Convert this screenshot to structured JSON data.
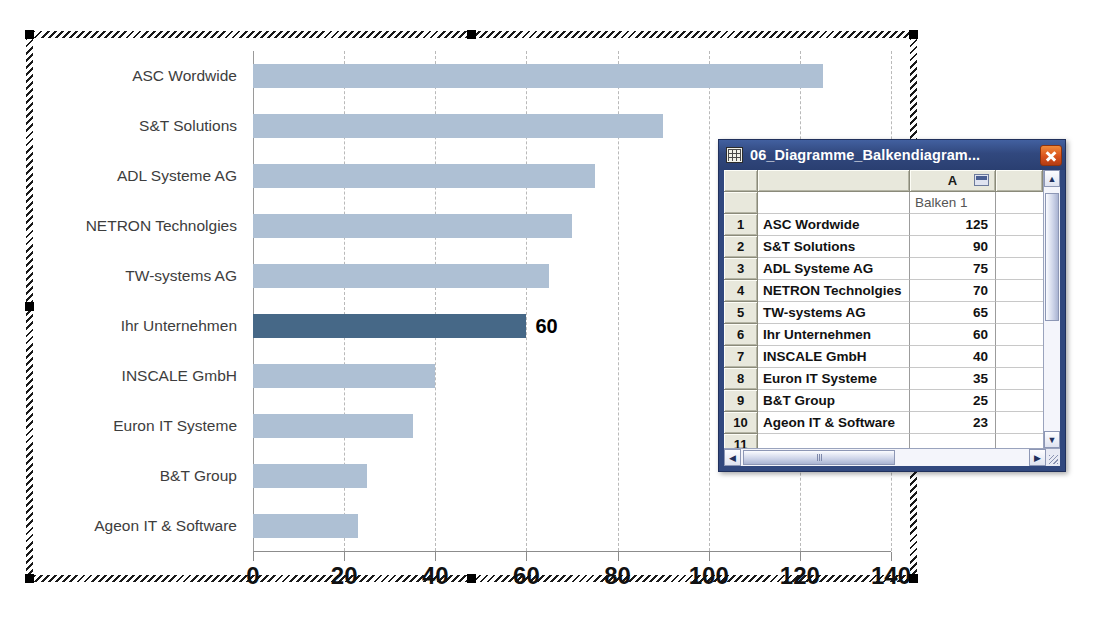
{
  "chart_data": {
    "type": "bar",
    "orientation": "horizontal",
    "title": "",
    "xlabel": "",
    "ylabel": "",
    "xlim": [
      0,
      140
    ],
    "xticks": [
      0,
      20,
      40,
      60,
      80,
      100,
      120,
      140
    ],
    "grid": true,
    "legend": false,
    "series_name": "Balken 1",
    "categories": [
      "ASC Wordwide",
      "S&T Solutions",
      "ADL Systeme AG",
      "NETRON Technolgies",
      "TW-systems AG",
      "Ihr Unternehmen",
      "INSCALE GmbH",
      "Euron IT Systeme",
      "B&T Group",
      "Ageon IT & Software"
    ],
    "values": [
      125,
      90,
      75,
      70,
      65,
      60,
      40,
      35,
      25,
      23
    ],
    "highlight_index": 5,
    "highlight_label": "60",
    "bar_color": "#aec0d4",
    "highlight_color": "#466887"
  },
  "chart_object": {
    "selected": true,
    "handle_count": 8
  },
  "sheet_window": {
    "title": "06_Diagramme_Balkendiagram...",
    "icon": "spreadsheet-icon",
    "close_label": "close-icon",
    "column_headers": {
      "corner": "",
      "b": "",
      "a": "A"
    },
    "subheader": {
      "label": "",
      "value": "Balken 1"
    },
    "rows": [
      {
        "num": "1",
        "name": "ASC Wordwide",
        "value": "125"
      },
      {
        "num": "2",
        "name": "S&T Solutions",
        "value": "90"
      },
      {
        "num": "3",
        "name": "ADL Systeme AG",
        "value": "75"
      },
      {
        "num": "4",
        "name": "NETRON Technolgies",
        "value": "70"
      },
      {
        "num": "5",
        "name": "TW-systems AG",
        "value": "65"
      },
      {
        "num": "6",
        "name": "Ihr Unternehmen",
        "value": "60"
      },
      {
        "num": "7",
        "name": "INSCALE GmbH",
        "value": "40"
      },
      {
        "num": "8",
        "name": "Euron IT Systeme",
        "value": "35"
      },
      {
        "num": "9",
        "name": "B&T Group",
        "value": "25"
      },
      {
        "num": "10",
        "name": "Ageon IT & Software",
        "value": "23"
      },
      {
        "num": "11",
        "name": "",
        "value": ""
      }
    ],
    "scroll": {
      "up_arrow": "▲",
      "down_arrow": "▼",
      "left_arrow": "◀",
      "right_arrow": "▶"
    }
  }
}
